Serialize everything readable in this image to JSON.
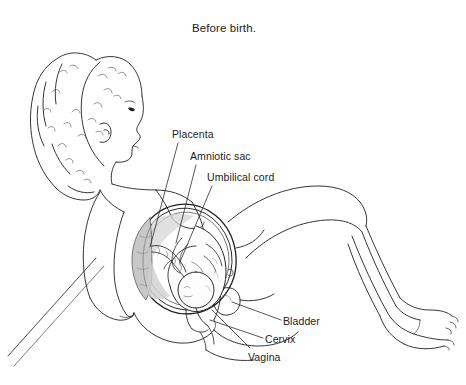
{
  "figure": {
    "title": "Before birth.",
    "background_color": "#ffffff",
    "line_color": "#1f1f1f",
    "shade_color": "#c8c8c8",
    "text_color": "#1c1c1c"
  },
  "labels": [
    {
      "id": "placenta",
      "text": "Placenta"
    },
    {
      "id": "amniotic-sac",
      "text": "Amniotic sac"
    },
    {
      "id": "umbilical-cord",
      "text": "Umbilical cord"
    },
    {
      "id": "bladder",
      "text": "Bladder"
    },
    {
      "id": "cervix",
      "text": "Cervix"
    },
    {
      "id": "vagina",
      "text": "Vagina"
    }
  ]
}
